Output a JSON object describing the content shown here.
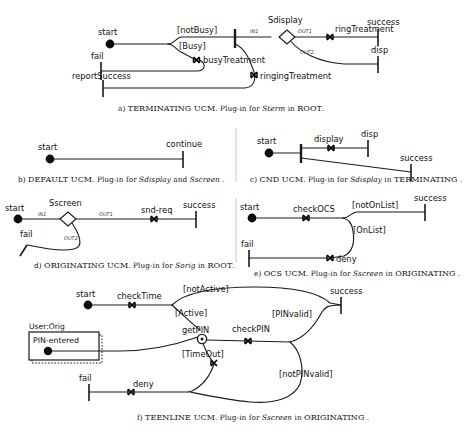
{
  "figure": {
    "panel_count": 6
  },
  "panels": {
    "a": {
      "caption_letter": "a)",
      "caption_name": "TERMINATING UCM",
      "caption_rest": ". Plug-in for ",
      "caption_italic": "Sterm",
      "caption_tail": " in ",
      "caption_parent": "ROOT",
      "caption_end": ".",
      "start_points": [
        "start",
        "fail",
        "reportSuccess"
      ],
      "end_points": [
        "success",
        "disp"
      ],
      "responsibilities": [
        "busyTreatment",
        "ringingTreatment",
        "ringTreatment"
      ],
      "conditions": [
        "[notBusy]",
        "[Busy]"
      ],
      "stub": {
        "name": "Sdisplay",
        "ports": [
          "IN1",
          "OUT1",
          "OUT2"
        ]
      }
    },
    "b": {
      "caption_letter": "b)",
      "caption_name": "DEFAULT UCM",
      "caption_rest": ". Plug-in for ",
      "caption_italic": "Sdisplay",
      "caption_tail": " and ",
      "caption_italic2": "Sscreen",
      "caption_end": " .",
      "start_points": [
        "start"
      ],
      "end_points": [
        "continue"
      ],
      "responsibilities": [],
      "conditions": []
    },
    "c": {
      "caption_letter": "c)",
      "caption_name": "CND UCM",
      "caption_rest": ". Plug-in for ",
      "caption_italic": "Sdisplay",
      "caption_tail": " in ",
      "caption_parent": "TERMINATING",
      "caption_end": " .",
      "start_points": [
        "start"
      ],
      "end_points": [
        "disp",
        "success"
      ],
      "responsibilities": [
        "display"
      ],
      "conditions": []
    },
    "d": {
      "caption_letter": "d)",
      "caption_name": "ORIGINATING UCM",
      "caption_rest": ". Plug-in for ",
      "caption_italic": "Sorig",
      "caption_tail": " in ",
      "caption_parent": "ROOT",
      "caption_end": ".",
      "start_points": [
        "start",
        "fail"
      ],
      "end_points": [
        "success"
      ],
      "responsibilities": [
        "snd-req"
      ],
      "conditions": [],
      "stub": {
        "name": "Sscreen",
        "ports": [
          "IN1",
          "OUT1",
          "OUT2"
        ]
      }
    },
    "e": {
      "caption_letter": "e)",
      "caption_name": "OCS UCM",
      "caption_rest": ". Plug-in for ",
      "caption_italic": "Sscreen",
      "caption_tail": " in ",
      "caption_parent": "ORIGINATING",
      "caption_end": " .",
      "start_points": [
        "start",
        "fail"
      ],
      "end_points": [
        "success"
      ],
      "responsibilities": [
        "checkOCS",
        "deny"
      ],
      "conditions": [
        "[notOnList]",
        "[OnList]"
      ]
    },
    "f": {
      "caption_letter": "f)",
      "caption_name": "TEENLINE UCM",
      "caption_rest": ". Plug-in for ",
      "caption_italic": "Sscreen",
      "caption_tail": " in ",
      "caption_parent": "ORIGINATING",
      "caption_end": " .",
      "start_points": [
        "start",
        "fail",
        "PIN-entered"
      ],
      "end_points": [
        "success"
      ],
      "responsibilities": [
        "checkTime",
        "checkPIN",
        "deny"
      ],
      "waiting_place": "getPIN",
      "conditions": [
        "[notActive]",
        "[Active]",
        "[PINvalid]",
        "[TimeOut]",
        "[notPINvalid]"
      ],
      "component": {
        "label": "User:Orig",
        "contained_start": "PIN-entered"
      }
    }
  },
  "labels": {
    "start": "start",
    "fail": "fail",
    "success": "success",
    "disp": "disp",
    "continue": "continue",
    "reportSuccess": "reportSuccess",
    "busyTreatment": "busyTreatment",
    "ringingTreatment": "ringingTreatment",
    "ringTreatment": "ringTreatment",
    "notBusy": "[notBusy]",
    "busy": "[Busy]",
    "Sdisplay": "Sdisplay",
    "Sscreen": "Sscreen",
    "in1": "IN1",
    "out1": "OUT1",
    "out2": "OUT2",
    "display": "display",
    "sndreq": "snd-req",
    "checkOCS": "checkOCS",
    "deny": "deny",
    "notOnList": "[notOnList]",
    "onList": "[OnList]",
    "checkTime": "checkTime",
    "getPIN": "getPIN",
    "checkPIN": "checkPIN",
    "notActive": "[notActive]",
    "active": "[Active]",
    "pinValid": "[PINvalid]",
    "timeOut": "[TimeOut]",
    "notPINvalid": "[notPINvalid]",
    "userOrig": "User:Orig",
    "pinEntered": "PIN-entered"
  },
  "colors": {
    "stroke": "#1a1a1a",
    "fill": "#ffffff",
    "text": "#111111",
    "divider": "#b9b9b9"
  }
}
